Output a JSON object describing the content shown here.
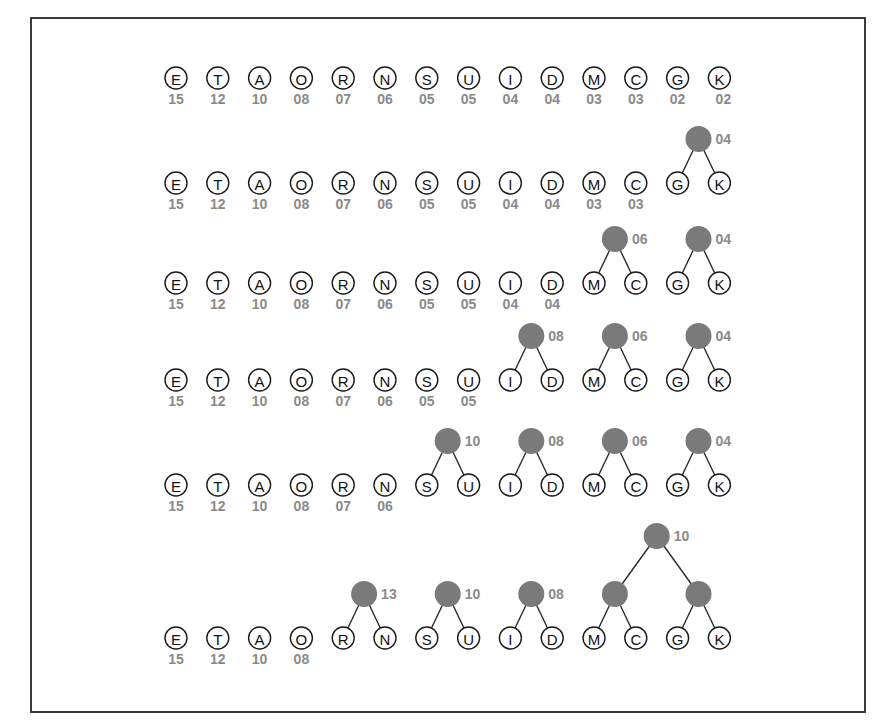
{
  "figure": {
    "letters": [
      "E",
      "T",
      "A",
      "O",
      "R",
      "N",
      "S",
      "U",
      "I",
      "D",
      "M",
      "C",
      "G",
      "K"
    ],
    "frequencies": [
      "15",
      "12",
      "10",
      "08",
      "07",
      "06",
      "05",
      "05",
      "04",
      "04",
      "03",
      "03",
      "02",
      "02"
    ],
    "colors": {
      "node_fill": "#7a7a7a",
      "label_gray": "#8a8a8a",
      "stroke": "#1a1a1a"
    },
    "steps": [
      {
        "freq_shown": 14,
        "nodes": []
      },
      {
        "freq_shown": 12,
        "nodes": [
          {
            "children": [
              12,
              13
            ],
            "label": "04"
          }
        ]
      },
      {
        "freq_shown": 10,
        "nodes": [
          {
            "children": [
              10,
              11
            ],
            "label": "06"
          },
          {
            "children": [
              12,
              13
            ],
            "label": "04"
          }
        ]
      },
      {
        "freq_shown": 8,
        "nodes": [
          {
            "children": [
              8,
              9
            ],
            "label": "08"
          },
          {
            "children": [
              10,
              11
            ],
            "label": "06"
          },
          {
            "children": [
              12,
              13
            ],
            "label": "04"
          }
        ]
      },
      {
        "freq_shown": 6,
        "nodes": [
          {
            "children": [
              6,
              7
            ],
            "label": "10"
          },
          {
            "children": [
              8,
              9
            ],
            "label": "08"
          },
          {
            "children": [
              10,
              11
            ],
            "label": "06"
          },
          {
            "children": [
              12,
              13
            ],
            "label": "04"
          }
        ]
      },
      {
        "freq_shown": 4,
        "nodes": [
          {
            "children": [
              4,
              5
            ],
            "label": "13"
          },
          {
            "children": [
              6,
              7
            ],
            "label": "10"
          },
          {
            "children": [
              8,
              9
            ],
            "label": "08"
          },
          {
            "children": [
              10,
              11
            ],
            "label": ""
          },
          {
            "children": [
              12,
              13
            ],
            "label": ""
          }
        ],
        "top_nodes": [
          {
            "children_nodes": [
              3,
              4
            ],
            "label": "10"
          }
        ]
      }
    ]
  }
}
